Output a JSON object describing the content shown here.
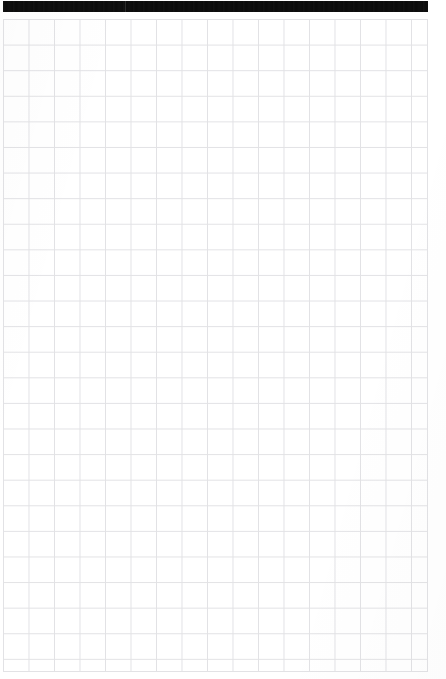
{
  "document": {
    "kind": "scanned-grid-page",
    "page_width": 446,
    "page_height": 679,
    "background_color": "#ffffff"
  },
  "header": {
    "background_color": "#0b0b0b",
    "title": "",
    "right_text": "",
    "divider_present": true
  },
  "grid": {
    "columns": 17,
    "rows": 26,
    "cell_width": 25.5,
    "cell_height": 25.6,
    "line_color": "#e2e2e5",
    "fill_color": "#ffffff",
    "left": 3,
    "top": 19,
    "width": 425,
    "height": 653,
    "content": ""
  }
}
